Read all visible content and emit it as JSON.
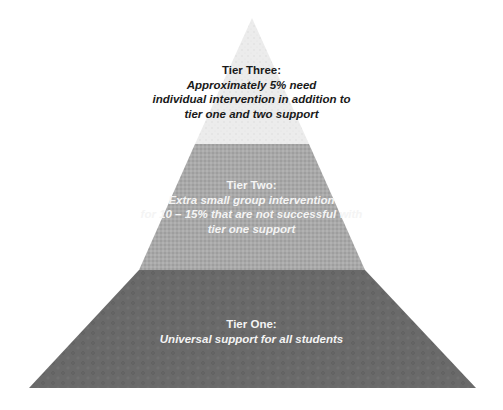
{
  "diagram": {
    "type": "pyramid",
    "colors": {
      "tier_three": "#ececec",
      "tier_two": "#a9a9a9",
      "tier_one": "#6a6a6a",
      "dark_text": "#1a1a1a",
      "light_text": "#f4f4f4"
    },
    "tiers": [
      {
        "id": "tier-three",
        "title": "Tier Three:",
        "description": "Approximately 5% need\nindividual intervention in addition to\ntier one and two support"
      },
      {
        "id": "tier-two",
        "title": "Tier Two:",
        "description": "Extra small group intervention\nfor 10 – 15% that are not successful with\ntier one support"
      },
      {
        "id": "tier-one",
        "title": "Tier One:",
        "description": "Universal support for all students"
      }
    ]
  }
}
